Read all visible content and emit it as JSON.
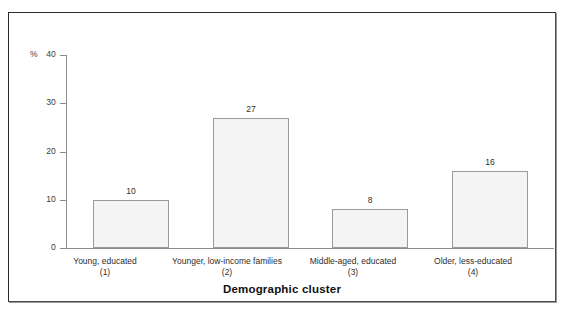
{
  "chart_data": {
    "type": "bar",
    "title": "",
    "xlabel": "Demographic cluster",
    "ylabel": "%",
    "ylim": [
      0,
      40
    ],
    "yticks": [
      0,
      10,
      20,
      30,
      40
    ],
    "grid": false,
    "legend": "none",
    "categories": [
      "Young, educated",
      "Younger, low-income families",
      "Middle-aged, educated",
      "Older, less-educated"
    ],
    "category_indices": [
      "(1)",
      "(2)",
      "(3)",
      "(4)"
    ],
    "values": [
      10,
      27,
      8,
      16
    ],
    "value_labels": [
      "10",
      "27",
      "8",
      "16"
    ],
    "bar_fill_color": "#f4f4f4",
    "bar_border_color": "#9b9b9b",
    "axis_color": "#8c8c8c",
    "frame_color": "#2b2b2b",
    "background_color": "#ffffff"
  },
  "axis": {
    "y_unit": "%",
    "tick_labels": [
      "0",
      "10",
      "20",
      "30",
      "40"
    ],
    "x_title": "Demographic cluster"
  }
}
